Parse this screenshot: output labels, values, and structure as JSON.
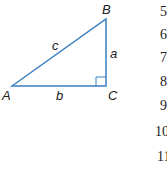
{
  "diagram": {
    "type": "right-triangle",
    "stroke_color": "#3b7fc1",
    "vertices": {
      "A": "A",
      "B": "B",
      "C": "C"
    },
    "sides": {
      "a": "a",
      "b": "b",
      "c": "c"
    },
    "right_angle_at": "C"
  },
  "line_numbers": [
    "5",
    "6",
    "7",
    "8",
    "9",
    "10",
    "11"
  ]
}
